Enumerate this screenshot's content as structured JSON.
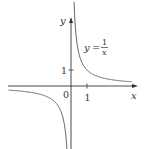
{
  "chart_data": {
    "type": "line",
    "title": "",
    "equation_label": {
      "lhs": "y",
      "eq": "=",
      "num": "1",
      "den": "x"
    },
    "xlabel": "x",
    "ylabel": "y",
    "origin_label": "0",
    "x_ticks": [
      {
        "value": 1,
        "label": "1"
      }
    ],
    "y_ticks": [
      {
        "value": 1,
        "label": "1"
      }
    ],
    "xlim": [
      -4.2,
      4.1
    ],
    "ylim": [
      -3.9,
      4.3
    ],
    "grid": false,
    "legend": "none",
    "series": [
      {
        "name": "y = 1/x",
        "function": "1/x",
        "branches": [
          {
            "x": [
              0.19,
              0.25,
              0.33,
              0.5,
              0.75,
              1,
              1.5,
              2,
              2.5,
              3,
              3.8
            ],
            "y": [
              5.26,
              4.0,
              3.03,
              2.0,
              1.33,
              1.0,
              0.67,
              0.5,
              0.4,
              0.33,
              0.26
            ]
          },
          {
            "x": [
              -3.9,
              -3,
              -2.5,
              -2,
              -1.5,
              -1,
              -0.75,
              -0.5,
              -0.33,
              -0.25,
              -0.19
            ],
            "y": [
              -0.26,
              -0.33,
              -0.4,
              -0.5,
              -0.67,
              -1.0,
              -1.33,
              -2.0,
              -3.03,
              -4.0,
              -5.26
            ]
          }
        ],
        "color": "#555555"
      }
    ]
  },
  "colors": {
    "axis": "#333333",
    "curve": "#666666",
    "text": "#333333"
  }
}
